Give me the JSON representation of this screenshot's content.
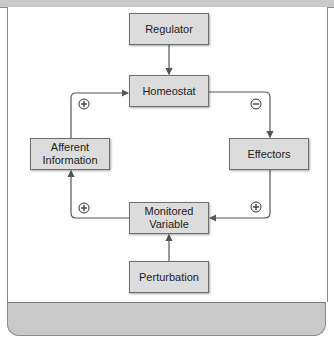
{
  "diagram": {
    "type": "homeostasis feedback loop",
    "nodes": {
      "regulator": "Regulator",
      "homeostat": "Homeostat",
      "afferent": "Afferent Information",
      "effectors": "Effectors",
      "monitored": "Monitored Variable",
      "perturbation": "Perturbation"
    },
    "signs": {
      "afferent_to_homeostat": "+",
      "homeostat_to_effectors": "−",
      "monitored_to_afferent": "+",
      "effectors_to_monitored": "+"
    },
    "edges": [
      {
        "from": "Regulator",
        "to": "Homeostat"
      },
      {
        "from": "Homeostat",
        "to": "Effectors",
        "sign": "−"
      },
      {
        "from": "Effectors",
        "to": "Monitored Variable",
        "sign": "+"
      },
      {
        "from": "Monitored Variable",
        "to": "Afferent Information",
        "sign": "+"
      },
      {
        "from": "Afferent Information",
        "to": "Homeostat",
        "sign": "+"
      },
      {
        "from": "Perturbation",
        "to": "Monitored Variable"
      }
    ],
    "colors": {
      "box_fill": "#dcdcdc",
      "line": "#555555",
      "band": "#c9c9c9"
    }
  }
}
